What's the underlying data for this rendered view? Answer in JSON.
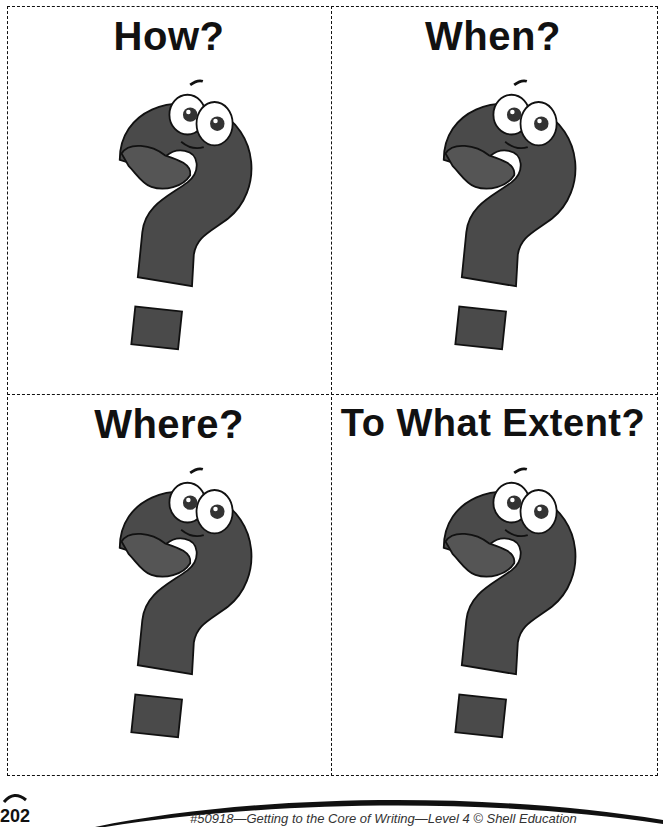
{
  "cards": [
    {
      "title": "How?",
      "icon": "question-mark-character-icon"
    },
    {
      "title": "When?",
      "icon": "question-mark-character-icon"
    },
    {
      "title": "Where?",
      "icon": "question-mark-character-icon"
    },
    {
      "title": "To What Extent?",
      "icon": "question-mark-character-icon"
    }
  ],
  "footer": {
    "page_number": "202",
    "citation": "#50918—Getting to the Core of Writing—Level 4 © Shell Education"
  },
  "colors": {
    "mascot_fill": "#4a4a4a",
    "outline": "#111111"
  }
}
